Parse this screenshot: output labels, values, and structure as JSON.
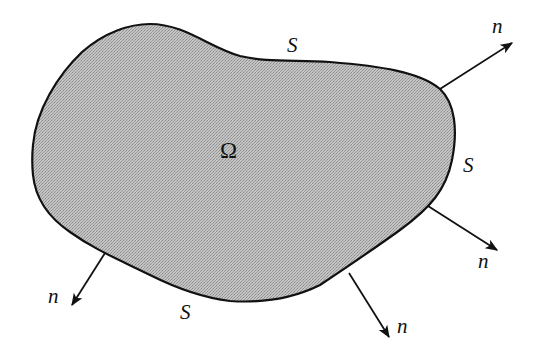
{
  "diagram": {
    "type": "domain-with-boundary-normals",
    "colors": {
      "region_fill": "#b9b9b9",
      "outline": "#111111",
      "background": "#ffffff"
    },
    "region": {
      "label": "Ω",
      "label_pos": [
        220,
        158
      ]
    },
    "boundary_labels": [
      {
        "text": "S",
        "pos": [
          293,
          54
        ]
      },
      {
        "text": "S",
        "pos": [
          467,
          172
        ]
      },
      {
        "text": "S",
        "pos": [
          183,
          319
        ]
      }
    ],
    "normals": [
      {
        "label": "n",
        "from": [
          440,
          89
        ],
        "to": [
          512,
          43
        ],
        "label_pos": [
          493,
          33
        ]
      },
      {
        "label": "n",
        "from": [
          428,
          206
        ],
        "to": [
          497,
          250
        ],
        "label_pos": [
          478,
          268
        ]
      },
      {
        "label": "n",
        "from": [
          349,
          273
        ],
        "to": [
          389,
          337
        ],
        "label_pos": [
          398,
          333
        ]
      },
      {
        "label": "n",
        "from": [
          105,
          253
        ],
        "to": [
          72,
          305
        ],
        "label_pos": [
          48,
          303
        ]
      }
    ]
  }
}
